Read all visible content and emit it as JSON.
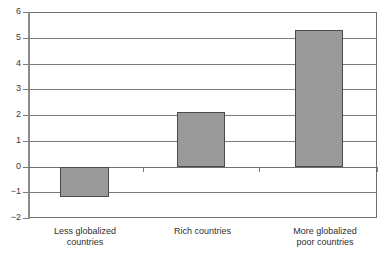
{
  "chart_data": {
    "type": "bar",
    "title": "",
    "subtitle": "",
    "xlabel": "",
    "ylabel": "",
    "categories": [
      "Less globalized\ncountries",
      "Rich countries",
      "More globalized\npoor countries"
    ],
    "values": [
      -1.2,
      2.1,
      5.3
    ],
    "ylim": [
      -2,
      6
    ],
    "ytick_labels": [
      "6",
      "5",
      "4",
      "3",
      "2",
      "1",
      "0",
      "−1",
      "−2"
    ],
    "ytick_values": [
      6,
      5,
      4,
      3,
      2,
      1,
      0,
      -1,
      -2
    ],
    "grid": true,
    "legend": "none",
    "bar_fill_color": "#9a9a9a",
    "bar_border_color": "#4a4a4a",
    "grid_color": "#7a7a7a",
    "axis_color": "#6f6f6f",
    "text_color": "#2e2e2e",
    "background_color": "#ffffff"
  },
  "axis": {
    "y_labels": [
      {
        "text": "6",
        "value": 6
      },
      {
        "text": "5",
        "value": 5
      },
      {
        "text": "4",
        "value": 4
      },
      {
        "text": "3",
        "value": 3
      },
      {
        "text": "2",
        "value": 2
      },
      {
        "text": "1",
        "value": 1
      },
      {
        "text": "0",
        "value": 0
      },
      {
        "text": "−1",
        "value": -1
      },
      {
        "text": "−2",
        "value": -2
      }
    ]
  },
  "bars": [
    {
      "label": "Less globalized\ncountries",
      "value": -1.2
    },
    {
      "label": "Rich countries",
      "value": 2.1
    },
    {
      "label": "More globalized\npoor countries",
      "value": 5.3
    }
  ]
}
